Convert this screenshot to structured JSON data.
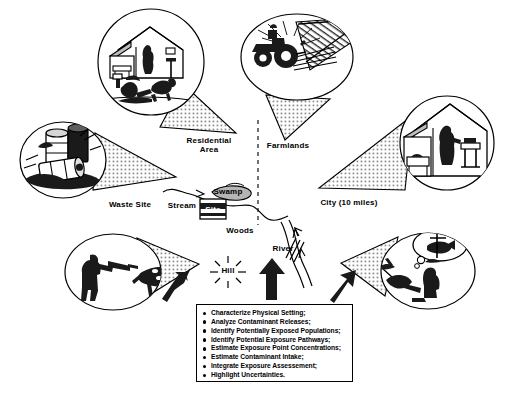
{
  "figure": {
    "background_color": "#ffffff",
    "ink_color": "#000000",
    "stipple_color": "#9a9a9a"
  },
  "map_labels": [
    {
      "id": "residential-area",
      "text": "Residential\nArea",
      "x": 209,
      "y": 143
    },
    {
      "id": "farmlands",
      "text": "Farmlands",
      "x": 288,
      "y": 147
    },
    {
      "id": "waste-site",
      "text": "Waste Site",
      "x": 130,
      "y": 206
    },
    {
      "id": "stream",
      "text": "Stream",
      "x": 182,
      "y": 207
    },
    {
      "id": "swamp",
      "text": "Swamp",
      "x": 228,
      "y": 193
    },
    {
      "id": "site",
      "text": "Site",
      "x": 213,
      "y": 211
    },
    {
      "id": "city",
      "text": "City (10 miles)",
      "x": 349,
      "y": 204
    },
    {
      "id": "woods",
      "text": "Woods",
      "x": 240,
      "y": 232
    },
    {
      "id": "river",
      "text": "River",
      "x": 283,
      "y": 250
    },
    {
      "id": "hill",
      "text": "Hill",
      "x": 228,
      "y": 271
    }
  ],
  "vignettes": [
    {
      "id": "residential-scene",
      "icon": "house-with-child-and-dog-icon",
      "description": "House with resident indoors and a child playing with a dog outdoors"
    },
    {
      "id": "farmland-scene",
      "icon": "tractor-plowing-field-icon",
      "description": "Tractor plowing a farm field beside a road"
    },
    {
      "id": "waste-site-scene",
      "icon": "leaking-drums-icon",
      "description": "Corroded and leaking chemical drums at the waste site"
    },
    {
      "id": "city-scene",
      "icon": "house-interior-kitchen-icon",
      "description": "Resident at a kitchen sink inside a city home"
    },
    {
      "id": "hunting-scene",
      "icon": "hunter-and-deer-icon",
      "description": "Hunter aiming a rifle at a grazing deer"
    },
    {
      "id": "fishing-scene",
      "icon": "fisherman-with-thought-icon",
      "description": "Fisherman catching fish with a thought bubble"
    }
  ],
  "task_box": {
    "items": [
      "Characterize Physical Setting;",
      "Analyze Contaminant Releases;",
      "Identify Potentially Exposed Populations;",
      "Identify Potential Exposure Pathways;",
      "Estimate Exposure Point Concentrations;",
      "Estimate Contaminant Intake;",
      "Integrate Exposure Assessement;",
      "Highlight Uncertainties."
    ]
  }
}
